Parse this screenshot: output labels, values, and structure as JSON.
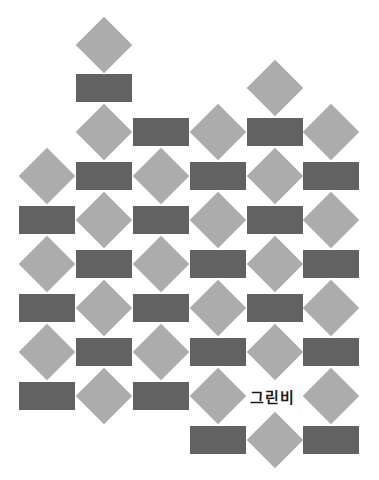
{
  "colors": {
    "background": "#ffffff",
    "rect": "#626262",
    "diamond": "#acacac",
    "text": "#1a1a1a"
  },
  "grid": {
    "col_centers": [
      47,
      104,
      161,
      218,
      275,
      331
    ],
    "row_centers": [
      45,
      88,
      132,
      176,
      220,
      264,
      308,
      352,
      396,
      440
    ]
  },
  "tiles": [
    {
      "shape": "diamond",
      "col": 1,
      "row": 0
    },
    {
      "shape": "rect",
      "col": 1,
      "row": 1
    },
    {
      "shape": "diamond",
      "col": 4,
      "row": 1
    },
    {
      "shape": "diamond",
      "col": 1,
      "row": 2
    },
    {
      "shape": "rect",
      "col": 2,
      "row": 2
    },
    {
      "shape": "diamond",
      "col": 3,
      "row": 2
    },
    {
      "shape": "rect",
      "col": 4,
      "row": 2
    },
    {
      "shape": "diamond",
      "col": 5,
      "row": 2
    },
    {
      "shape": "diamond",
      "col": 0,
      "row": 3
    },
    {
      "shape": "rect",
      "col": 1,
      "row": 3
    },
    {
      "shape": "diamond",
      "col": 2,
      "row": 3
    },
    {
      "shape": "rect",
      "col": 3,
      "row": 3
    },
    {
      "shape": "diamond",
      "col": 4,
      "row": 3
    },
    {
      "shape": "rect",
      "col": 5,
      "row": 3
    },
    {
      "shape": "rect",
      "col": 0,
      "row": 4
    },
    {
      "shape": "diamond",
      "col": 1,
      "row": 4
    },
    {
      "shape": "rect",
      "col": 2,
      "row": 4
    },
    {
      "shape": "diamond",
      "col": 3,
      "row": 4
    },
    {
      "shape": "rect",
      "col": 4,
      "row": 4
    },
    {
      "shape": "diamond",
      "col": 5,
      "row": 4
    },
    {
      "shape": "diamond",
      "col": 0,
      "row": 5
    },
    {
      "shape": "rect",
      "col": 1,
      "row": 5
    },
    {
      "shape": "diamond",
      "col": 2,
      "row": 5
    },
    {
      "shape": "rect",
      "col": 3,
      "row": 5
    },
    {
      "shape": "diamond",
      "col": 4,
      "row": 5
    },
    {
      "shape": "rect",
      "col": 5,
      "row": 5
    },
    {
      "shape": "rect",
      "col": 0,
      "row": 6
    },
    {
      "shape": "diamond",
      "col": 1,
      "row": 6
    },
    {
      "shape": "rect",
      "col": 2,
      "row": 6
    },
    {
      "shape": "diamond",
      "col": 3,
      "row": 6
    },
    {
      "shape": "rect",
      "col": 4,
      "row": 6
    },
    {
      "shape": "diamond",
      "col": 5,
      "row": 6
    },
    {
      "shape": "diamond",
      "col": 0,
      "row": 7
    },
    {
      "shape": "rect",
      "col": 1,
      "row": 7
    },
    {
      "shape": "diamond",
      "col": 2,
      "row": 7
    },
    {
      "shape": "rect",
      "col": 3,
      "row": 7
    },
    {
      "shape": "diamond",
      "col": 4,
      "row": 7
    },
    {
      "shape": "rect",
      "col": 5,
      "row": 7
    },
    {
      "shape": "rect",
      "col": 0,
      "row": 8
    },
    {
      "shape": "diamond",
      "col": 1,
      "row": 8
    },
    {
      "shape": "rect",
      "col": 2,
      "row": 8
    },
    {
      "shape": "diamond",
      "col": 3,
      "row": 8
    },
    {
      "shape": "diamond",
      "col": 5,
      "row": 8
    },
    {
      "shape": "rect",
      "col": 3,
      "row": 9
    },
    {
      "shape": "diamond",
      "col": 4,
      "row": 9
    },
    {
      "shape": "rect",
      "col": 5,
      "row": 9
    }
  ],
  "label": {
    "text": "그린비",
    "col": 4,
    "row": 8
  }
}
